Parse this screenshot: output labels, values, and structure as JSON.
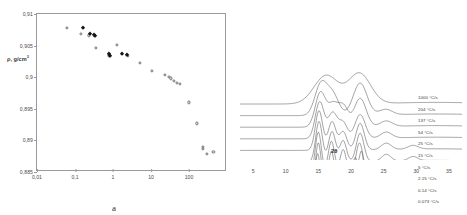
{
  "figure": {
    "panels": [
      {
        "id": "a",
        "caption": "a"
      },
      {
        "id": "b",
        "caption": "b"
      }
    ]
  },
  "panel_a": {
    "caption": "a",
    "ylabel": "ρ, g/cm",
    "ylabel_sup": "3",
    "xlabel": "dT/dt@70°C, °C/s",
    "yticks": [
      "0,885",
      "0,89",
      "0,895",
      "0,9",
      "0,905",
      "0,91"
    ],
    "xticks": [
      "0,01",
      "0,1",
      "1",
      "10",
      "100"
    ]
  },
  "panel_b": {
    "caption": "b",
    "xlabel": "2θ",
    "xticks": [
      "5",
      "10",
      "15",
      "20",
      "25",
      "30",
      "35"
    ],
    "curve_labels": [
      "1000 °C/s",
      "204 °C/s",
      "137 °C/s",
      "54 °C/s",
      "25 °C/s",
      "15 °C/s",
      "5 °C/s",
      "2.15 °C/s",
      "0.14 °C/s",
      "0.073 °C/s"
    ]
  },
  "chart_data": [
    {
      "type": "scatter",
      "panel": "a",
      "title": "",
      "xlabel": "dT/dt@70°C, °C/s",
      "ylabel": "ρ, g/cm3",
      "xscale": "log",
      "xlim": [
        0.01,
        1000
      ],
      "ylim": [
        0.885,
        0.91
      ],
      "xticks": [
        0.01,
        0.1,
        1,
        10,
        100
      ],
      "yticks": [
        0.885,
        0.89,
        0.895,
        0.9,
        0.905,
        0.91
      ],
      "grid": false,
      "legend": "none",
      "series": [
        {
          "name": "open-circles",
          "marker": "open circle",
          "points": [
            [
              0.062,
              0.9078
            ],
            [
              0.145,
              0.9068
            ],
            [
              0.23,
              0.9066
            ],
            [
              0.33,
              0.9065
            ],
            [
              0.35,
              0.9046
            ],
            [
              0.78,
              0.9035
            ],
            [
              0.8,
              0.9034
            ],
            [
              1.25,
              0.9051
            ],
            [
              2.3,
              0.9035
            ],
            [
              2.5,
              0.9034
            ],
            [
              5.0,
              0.9022
            ],
            [
              10.5,
              0.901
            ],
            [
              23.0,
              0.9003
            ],
            [
              30.0,
              0.9
            ],
            [
              33.0,
              0.8998
            ],
            [
              40.0,
              0.8994
            ],
            [
              48.0,
              0.8991
            ],
            [
              58.0,
              0.8989
            ],
            [
              100.0,
              0.896
            ],
            [
              160.0,
              0.8927
            ],
            [
              230.0,
              0.889
            ],
            [
              235.0,
              0.8886
            ],
            [
              290.0,
              0.8878
            ],
            [
              440.0,
              0.8882
            ]
          ]
        },
        {
          "name": "filled-diamonds",
          "marker": "filled diamond",
          "points": [
            [
              0.16,
              0.9078
            ],
            [
              0.245,
              0.9068
            ],
            [
              0.32,
              0.9066
            ],
            [
              0.345,
              0.9065
            ],
            [
              0.8,
              0.9036
            ],
            [
              0.85,
              0.9034
            ],
            [
              1.75,
              0.9036
            ],
            [
              2.35,
              0.9035
            ]
          ]
        }
      ]
    },
    {
      "type": "line",
      "panel": "b",
      "title": "",
      "xlabel": "2θ",
      "ylabel": "Intensity (offset, a.u.)",
      "xlim": [
        3,
        37
      ],
      "xticks": [
        5,
        10,
        15,
        20,
        25,
        30,
        35
      ],
      "grid": false,
      "legend": "right, inline per-curve",
      "note": "Stacked XRD diffractograms; peaks sharpen as cooling rate decreases",
      "series": [
        {
          "name": "1000 °C/s",
          "offset_index": 0,
          "peaks": [
            {
              "x": 16.2,
              "h": 0.62,
              "w": 2.6
            },
            {
              "x": 21.3,
              "h": 0.66,
              "w": 2.4
            }
          ]
        },
        {
          "name": "204 °C/s",
          "offset_index": 1,
          "peaks": [
            {
              "x": 15.4,
              "h": 0.68,
              "w": 1.3
            },
            {
              "x": 17.2,
              "h": 0.45,
              "w": 1.3
            },
            {
              "x": 21.4,
              "h": 0.7,
              "w": 1.5
            },
            {
              "x": 25.3,
              "h": 0.12,
              "w": 1.4
            }
          ]
        },
        {
          "name": "137 °C/s",
          "offset_index": 2,
          "peaks": [
            {
              "x": 15.3,
              "h": 0.74,
              "w": 1.1
            },
            {
              "x": 17.3,
              "h": 0.5,
              "w": 1.2
            },
            {
              "x": 18.9,
              "h": 0.4,
              "w": 1.0
            },
            {
              "x": 21.4,
              "h": 0.62,
              "w": 1.3
            },
            {
              "x": 25.4,
              "h": 0.12,
              "w": 1.3
            }
          ]
        },
        {
          "name": "54 °C/s",
          "offset_index": 3,
          "peaks": [
            {
              "x": 15.2,
              "h": 0.8,
              "w": 0.95
            },
            {
              "x": 17.2,
              "h": 0.56,
              "w": 1.0
            },
            {
              "x": 18.8,
              "h": 0.34,
              "w": 0.9
            },
            {
              "x": 21.4,
              "h": 0.52,
              "w": 1.1
            },
            {
              "x": 25.4,
              "h": 0.13,
              "w": 1.2
            }
          ]
        },
        {
          "name": "25 °C/s",
          "offset_index": 4,
          "peaks": [
            {
              "x": 15.1,
              "h": 0.86,
              "w": 0.8
            },
            {
              "x": 17.1,
              "h": 0.62,
              "w": 0.85
            },
            {
              "x": 18.8,
              "h": 0.4,
              "w": 0.8
            },
            {
              "x": 21.4,
              "h": 0.58,
              "w": 0.9
            },
            {
              "x": 25.4,
              "h": 0.14,
              "w": 1.1
            },
            {
              "x": 29.5,
              "h": 0.08,
              "w": 1.1
            }
          ]
        },
        {
          "name": "15 °C/s",
          "offset_index": 5,
          "peaks": [
            {
              "x": 15.1,
              "h": 0.88,
              "w": 0.72
            },
            {
              "x": 17.1,
              "h": 0.66,
              "w": 0.78
            },
            {
              "x": 18.8,
              "h": 0.46,
              "w": 0.72
            },
            {
              "x": 21.4,
              "h": 0.62,
              "w": 0.82
            },
            {
              "x": 25.4,
              "h": 0.15,
              "w": 1.0
            },
            {
              "x": 29.5,
              "h": 0.09,
              "w": 1.0
            }
          ]
        },
        {
          "name": "5 °C/s",
          "offset_index": 6,
          "peaks": [
            {
              "x": 15.0,
              "h": 0.9,
              "w": 0.66
            },
            {
              "x": 17.0,
              "h": 0.7,
              "w": 0.7
            },
            {
              "x": 18.8,
              "h": 0.52,
              "w": 0.66
            },
            {
              "x": 21.3,
              "h": 0.66,
              "w": 0.74
            },
            {
              "x": 25.4,
              "h": 0.16,
              "w": 0.95
            },
            {
              "x": 29.5,
              "h": 0.1,
              "w": 0.95
            }
          ]
        },
        {
          "name": "2.15 °C/s",
          "offset_index": 7,
          "peaks": [
            {
              "x": 15.0,
              "h": 0.92,
              "w": 0.6
            },
            {
              "x": 17.0,
              "h": 0.74,
              "w": 0.62
            },
            {
              "x": 20.6,
              "h": 0.58,
              "w": 0.52
            },
            {
              "x": 21.6,
              "h": 0.72,
              "w": 0.52
            },
            {
              "x": 25.4,
              "h": 0.16,
              "w": 0.9
            },
            {
              "x": 29.5,
              "h": 0.1,
              "w": 0.9
            }
          ]
        },
        {
          "name": "0.14 °C/s",
          "offset_index": 8,
          "peaks": [
            {
              "x": 14.9,
              "h": 0.94,
              "w": 0.55
            },
            {
              "x": 17.0,
              "h": 0.78,
              "w": 0.56
            },
            {
              "x": 20.6,
              "h": 0.62,
              "w": 0.46
            },
            {
              "x": 21.6,
              "h": 0.76,
              "w": 0.46
            },
            {
              "x": 25.4,
              "h": 0.17,
              "w": 0.85
            },
            {
              "x": 29.5,
              "h": 0.11,
              "w": 0.85
            }
          ]
        },
        {
          "name": "0.073 °C/s",
          "offset_index": 9,
          "peaks": [
            {
              "x": 14.9,
              "h": 0.96,
              "w": 0.5
            },
            {
              "x": 17.0,
              "h": 0.82,
              "w": 0.52
            },
            {
              "x": 20.6,
              "h": 0.66,
              "w": 0.42
            },
            {
              "x": 21.6,
              "h": 0.8,
              "w": 0.42
            },
            {
              "x": 25.4,
              "h": 0.18,
              "w": 0.8
            },
            {
              "x": 29.5,
              "h": 0.12,
              "w": 0.8
            }
          ]
        }
      ]
    }
  ]
}
